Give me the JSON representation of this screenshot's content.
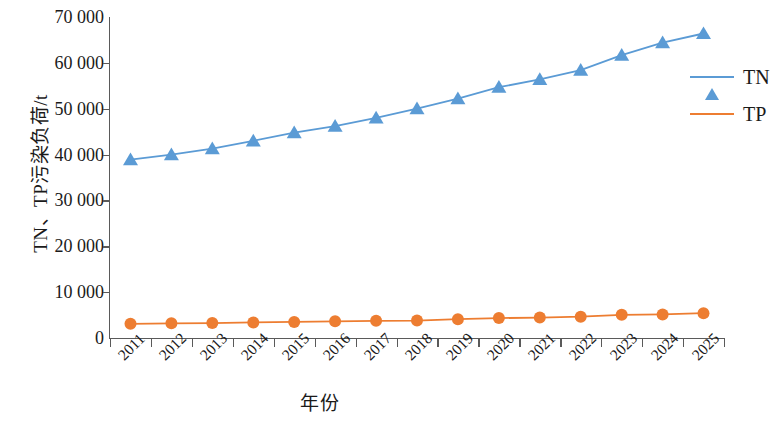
{
  "chart_data": {
    "type": "line",
    "title": "",
    "xlabel": "年份",
    "ylabel": "TN、TP污染负荷/t",
    "categories": [
      "2011",
      "2012",
      "2013",
      "2014",
      "2015",
      "2016",
      "2017",
      "2018",
      "2019",
      "2020",
      "2021",
      "2022",
      "2023",
      "2024",
      "2025"
    ],
    "ylim": [
      0,
      70000
    ],
    "ytick_labels": [
      "70 000",
      "60 000",
      "50 000",
      "40 000",
      "30 000",
      "20 000",
      "10 000",
      "0"
    ],
    "ytick_values": [
      70000,
      60000,
      50000,
      40000,
      30000,
      20000,
      10000,
      0
    ],
    "grid": false,
    "legend_position": "right",
    "series": [
      {
        "name": "TN",
        "color": "#5B9BD5",
        "marker": "triangle",
        "values": [
          38900,
          40000,
          41300,
          43000,
          44800,
          46200,
          48000,
          50000,
          52200,
          54700,
          56400,
          58400,
          61700,
          64400,
          66400
        ]
      },
      {
        "name": "TP",
        "color": "#ED7D31",
        "marker": "circle",
        "values": [
          3100,
          3200,
          3250,
          3400,
          3500,
          3650,
          3750,
          3800,
          4100,
          4350,
          4450,
          4650,
          5050,
          5150,
          5400
        ]
      }
    ]
  },
  "axis": {
    "y_title": "TN、TP污染负荷/t",
    "x_title": "年份"
  },
  "legend": {
    "items": [
      {
        "label": "TN",
        "color": "#5B9BD5"
      },
      {
        "label": "TP",
        "color": "#ED7D31"
      }
    ]
  },
  "colors": {
    "tn": "#5B9BD5",
    "tp": "#ED7D31",
    "axis": "#5a5a5a",
    "text": "#1a1a1a",
    "background": "#ffffff"
  }
}
